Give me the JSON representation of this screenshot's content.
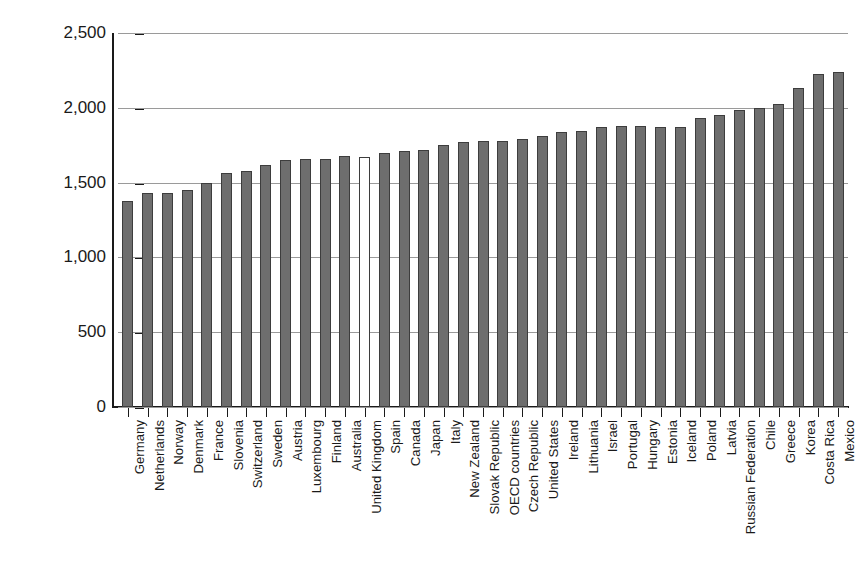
{
  "chart_data": {
    "type": "bar",
    "title": "",
    "subtitle": "",
    "xlabel": "",
    "ylabel": "Average number of hours worked by workers",
    "ylim": [
      0,
      2500
    ],
    "ytick_values": [
      0,
      500,
      1000,
      1500,
      2000,
      2500
    ],
    "ytick_labels": [
      "0",
      "500",
      "1,000",
      "1,500",
      "2,000",
      "2,500"
    ],
    "grid": "horizontal",
    "legend": "none",
    "highlight_category": "United Kingdom",
    "bar_color": "#6e6e6e",
    "highlight_bar_color": "#ffffff",
    "bar_edge_color": "#3d3d3d",
    "axis_color": "#1a1a1a",
    "grid_color": "#9a9a9a",
    "categories": [
      "Germany",
      "Netherlands",
      "Norway",
      "Denmark",
      "France",
      "Slovenia",
      "Switzerland",
      "Sweden",
      "Austria",
      "Luxembourg",
      "Finland",
      "Australia",
      "United Kingdom",
      "Spain",
      "Canada",
      "Japan",
      "Italy",
      "New Zealand",
      "Slovak Republic",
      "OECD countries",
      "Czech Republic",
      "United States",
      "Ireland",
      "Lithuania",
      "Israel",
      "Portugal",
      "Hungary",
      "Estonia",
      "Iceland",
      "Poland",
      "Latvia",
      "Russian Federation",
      "Chile",
      "Greece",
      "Korea",
      "Costa Rica",
      "Mexico"
    ],
    "values": [
      1380,
      1430,
      1430,
      1450,
      1500,
      1565,
      1580,
      1615,
      1650,
      1660,
      1660,
      1680,
      1670,
      1695,
      1710,
      1720,
      1750,
      1770,
      1780,
      1780,
      1790,
      1810,
      1840,
      1845,
      1875,
      1880,
      1880,
      1875,
      1875,
      1935,
      1955,
      1985,
      2000,
      2025,
      2130,
      2225,
      2240
    ]
  }
}
